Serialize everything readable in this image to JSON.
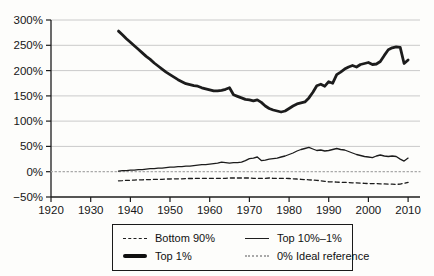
{
  "chart_data": {
    "type": "line",
    "title": "",
    "xlabel": "",
    "ylabel": "",
    "xlim": [
      1920,
      2013
    ],
    "ylim": [
      -50,
      300
    ],
    "grid": true,
    "grid_values": [
      50,
      100,
      150,
      200,
      250,
      300
    ],
    "yticks": [
      {
        "value": 300,
        "label": "300%"
      },
      {
        "value": 250,
        "label": "250%"
      },
      {
        "value": 200,
        "label": "200%"
      },
      {
        "value": 150,
        "label": "150%"
      },
      {
        "value": 100,
        "label": "100%"
      },
      {
        "value": 50,
        "label": "50%"
      },
      {
        "value": 0,
        "label": "0%"
      },
      {
        "value": -50,
        "label": "−50%"
      }
    ],
    "xticks": [
      {
        "value": 1920,
        "label": "1920"
      },
      {
        "value": 1930,
        "label": "1930"
      },
      {
        "value": 1940,
        "label": "1940"
      },
      {
        "value": 1950,
        "label": "1950"
      },
      {
        "value": 1960,
        "label": "1960"
      },
      {
        "value": 1970,
        "label": "1970"
      },
      {
        "value": 1980,
        "label": "1980"
      },
      {
        "value": 1990,
        "label": "1990"
      },
      {
        "value": 2000,
        "label": "2000"
      },
      {
        "value": 2010,
        "label": "2010"
      }
    ],
    "colors": {
      "line": "#1c1c1c",
      "grid": "#cacaca",
      "axis": "#1c1c1c",
      "reference": "#a9a9a9",
      "background": "#fdfdfb"
    },
    "series": [
      {
        "name": "0% Ideal reference",
        "data_name": "ideal-reference-line",
        "style": "dotted",
        "width": 1.2,
        "dash": "1.5 2.5",
        "color": "#a9a9a9",
        "x": [
          1920,
          2013
        ],
        "values": [
          0,
          0
        ]
      },
      {
        "name": "Bottom 90%",
        "data_name": "bottom-90pct-line",
        "style": "dashed",
        "width": 1.3,
        "dash": "4 3",
        "start_year": 1937,
        "values": [
          -18,
          -17.5,
          -17,
          -17,
          -16.5,
          -16,
          -16,
          -15.5,
          -15.5,
          -15,
          -15,
          -15,
          -14.5,
          -14.5,
          -14,
          -14,
          -14,
          -13.5,
          -13.5,
          -13.5,
          -13,
          -13,
          -13,
          -13,
          -13,
          -13,
          -13,
          -13,
          -12.5,
          -12.5,
          -12.5,
          -12.5,
          -12.5,
          -12.5,
          -13,
          -13,
          -13,
          -13,
          -12.5,
          -13,
          -13,
          -13,
          -13,
          -13.5,
          -14,
          -14.5,
          -15,
          -15.5,
          -16,
          -16.5,
          -17,
          -18,
          -19,
          -20,
          -20,
          -20.5,
          -21,
          -21,
          -21.5,
          -22,
          -22,
          -22.5,
          -23,
          -23.5,
          -23.5,
          -23.5,
          -24,
          -24,
          -24.5,
          -24.5,
          -25,
          -24.5,
          -23,
          -21
        ]
      },
      {
        "name": "Top 10%–1%",
        "data_name": "top-10-1pct-line",
        "style": "solid-thin",
        "width": 1.3,
        "start_year": 1937,
        "values": [
          1,
          2,
          2,
          3,
          3,
          4,
          4,
          5,
          6,
          6,
          7,
          7,
          8,
          9,
          9,
          10,
          10,
          11,
          11,
          12,
          13,
          14,
          14,
          15,
          16,
          17,
          19,
          18,
          17,
          18,
          18,
          19,
          22,
          26,
          27,
          29,
          22,
          23,
          25,
          26,
          27,
          29,
          31,
          34,
          37,
          41,
          44,
          46,
          48,
          45,
          42,
          43,
          41,
          42,
          44,
          46,
          44,
          43,
          40,
          37,
          34,
          32,
          30,
          29,
          28,
          31,
          33,
          31,
          30,
          31,
          30,
          25,
          21,
          27
        ]
      },
      {
        "name": "Top 1%",
        "data_name": "top-1pct-line",
        "style": "solid-thick",
        "width": 2.8,
        "start_year": 1937,
        "values": [
          278,
          271,
          263,
          256,
          249,
          242,
          235,
          228,
          222,
          215,
          209,
          203,
          197,
          192,
          187,
          182,
          178,
          174,
          172,
          170,
          169,
          166,
          164,
          162,
          160,
          160,
          161,
          163,
          166,
          152,
          149,
          146,
          143,
          142,
          140,
          142,
          137,
          130,
          125,
          122,
          120,
          118,
          120,
          125,
          130,
          134,
          136,
          138,
          146,
          157,
          170,
          173,
          169,
          178,
          175,
          192,
          197,
          203,
          207,
          210,
          207,
          212,
          214,
          216,
          212,
          213,
          218,
          230,
          241,
          245,
          247,
          246,
          214,
          221
        ]
      }
    ],
    "legend": {
      "position": "bottom",
      "items": [
        {
          "label": "Bottom 90%",
          "style": "dashed"
        },
        {
          "label": "Top 10%–1%",
          "style": "solid-thin"
        },
        {
          "label": "Top 1%",
          "style": "solid-thick"
        },
        {
          "label": "0% Ideal reference",
          "style": "dotted"
        }
      ]
    }
  }
}
